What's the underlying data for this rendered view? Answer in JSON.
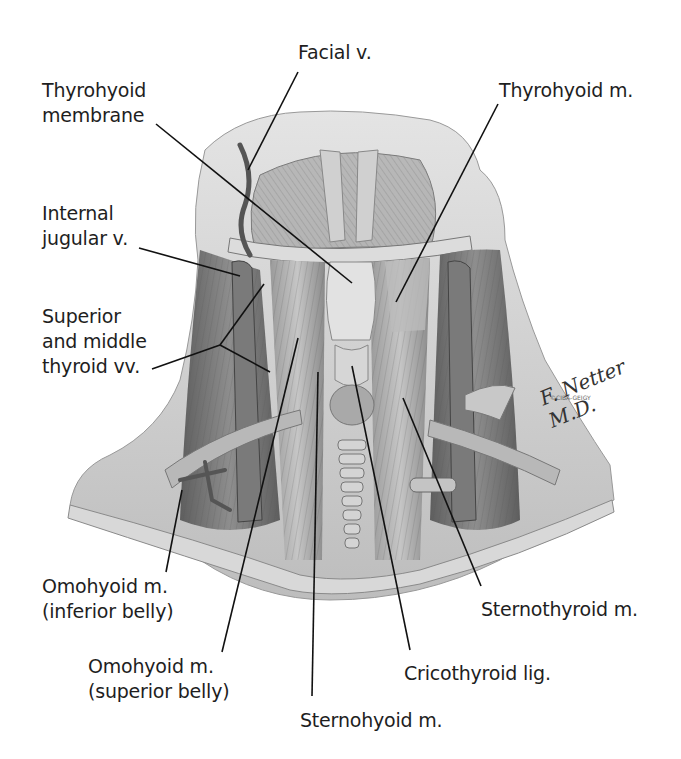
{
  "figure": {
    "signature": "F. Netter M.D.",
    "copyright": "©CIBA-GEIGY"
  },
  "labels": [
    {
      "id": "facial-v",
      "text": "Facial v.",
      "x": 298,
      "y": 40,
      "line": [
        [
          298,
          72
        ],
        [
          248,
          170
        ]
      ]
    },
    {
      "id": "thyrohyoid-membrane",
      "text": "Thyrohyoid\nmembrane",
      "x": 42,
      "y": 78,
      "line": [
        [
          156,
          124
        ],
        [
          352,
          283
        ]
      ]
    },
    {
      "id": "thyrohyoid-m",
      "text": "Thyrohyoid m.",
      "x": 499,
      "y": 78,
      "line": [
        [
          498,
          104
        ],
        [
          396,
          302
        ]
      ]
    },
    {
      "id": "internal-jugular-v",
      "text": "Internal\njugular v.",
      "x": 42,
      "y": 201,
      "line": [
        [
          139,
          248
        ],
        [
          240,
          276
        ]
      ]
    },
    {
      "id": "superior-middle-thyroid-vv",
      "text": "Superior\nand middle\nthyroid vv.",
      "x": 42,
      "y": 304,
      "line": [
        [
          152,
          369
        ],
        [
          220,
          345
        ]
      ],
      "branches": [
        [
          [
            220,
            345
          ],
          [
            264,
            284
          ]
        ],
        [
          [
            220,
            345
          ],
          [
            270,
            372
          ]
        ]
      ]
    },
    {
      "id": "omohyoid-inferior-belly",
      "text": "Omohyoid m.\n(inferior belly)",
      "x": 42,
      "y": 574,
      "line": [
        [
          166,
          572
        ],
        [
          182,
          490
        ]
      ]
    },
    {
      "id": "omohyoid-superior-belly",
      "text": "Omohyoid m.\n(superior belly)",
      "x": 88,
      "y": 654,
      "line": [
        [
          222,
          652
        ],
        [
          298,
          338
        ]
      ]
    },
    {
      "id": "sternohyoid-m",
      "text": "Sternohyoid m.",
      "x": 300,
      "y": 708,
      "line": [
        [
          312,
          696
        ],
        [
          318,
          372
        ]
      ]
    },
    {
      "id": "cricothyroid-lig",
      "text": "Cricothyroid lig.",
      "x": 404,
      "y": 661,
      "line": [
        [
          410,
          650
        ],
        [
          352,
          366
        ]
      ]
    },
    {
      "id": "sternothyroid-m",
      "text": "Sternothyroid m.",
      "x": 481,
      "y": 597,
      "line": [
        [
          481,
          586
        ],
        [
          403,
          398
        ]
      ]
    }
  ],
  "colors": {
    "text": "#1e1e1e",
    "leader": "#111111",
    "skin_light": "#d9d9d9",
    "skin_mid": "#b5b5b5",
    "muscle_dark": "#6a6a6a",
    "muscle_mid": "#8c8c8c",
    "cartilage": "#cfcfcf"
  }
}
